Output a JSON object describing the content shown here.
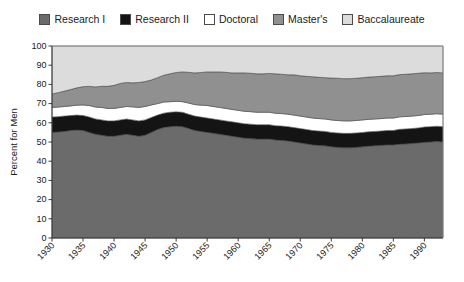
{
  "legend": {
    "position": "top-center",
    "items": [
      {
        "label": "Research I",
        "color": "#6b6b6b",
        "icon": "legend-swatch-icon"
      },
      {
        "label": "Research II",
        "color": "#141414",
        "icon": "legend-swatch-icon"
      },
      {
        "label": "Doctoral",
        "color": "#ffffff",
        "icon": "legend-swatch-icon"
      },
      {
        "label": "Master's",
        "color": "#909090",
        "icon": "legend-swatch-icon"
      },
      {
        "label": "Baccalaureate",
        "color": "#dcdcdc",
        "icon": "legend-swatch-icon"
      }
    ]
  },
  "chart_data": {
    "type": "area",
    "stacked": true,
    "title": "",
    "subtitle": "",
    "xlabel": "",
    "ylabel": "Percent for Men",
    "xlim": [
      1930,
      1993
    ],
    "ylim": [
      0,
      100
    ],
    "grid": false,
    "legend_position": "top-center",
    "ytick_values": [
      0,
      10,
      20,
      30,
      40,
      50,
      60,
      70,
      80,
      90,
      100
    ],
    "ytick_labels": [
      "0",
      "10",
      "20",
      "30",
      "40",
      "50",
      "60",
      "70",
      "80",
      "90",
      "100"
    ],
    "xtick_values": [
      1930,
      1935,
      1940,
      1945,
      1950,
      1955,
      1960,
      1965,
      1970,
      1975,
      1980,
      1985,
      1990
    ],
    "xtick_labels": [
      "1930",
      "1935",
      "1940",
      "1945",
      "1950",
      "1955",
      "1960",
      "1965",
      "1970",
      "1975",
      "1980",
      "1985",
      "1990"
    ],
    "x": [
      1930,
      1931,
      1932,
      1933,
      1934,
      1935,
      1936,
      1937,
      1938,
      1939,
      1940,
      1941,
      1942,
      1943,
      1944,
      1945,
      1946,
      1947,
      1948,
      1949,
      1950,
      1951,
      1952,
      1953,
      1954,
      1955,
      1956,
      1957,
      1958,
      1959,
      1960,
      1961,
      1962,
      1963,
      1964,
      1965,
      1966,
      1967,
      1968,
      1969,
      1970,
      1971,
      1972,
      1973,
      1974,
      1975,
      1976,
      1977,
      1978,
      1979,
      1980,
      1981,
      1982,
      1983,
      1984,
      1985,
      1986,
      1987,
      1988,
      1989,
      1990,
      1991,
      1992,
      1993
    ],
    "series": [
      {
        "name": "Research I",
        "color": "#6b6b6b",
        "values": [
          55.0,
          55.2,
          55.5,
          56.0,
          56.2,
          56.0,
          55.0,
          54.0,
          53.5,
          53.0,
          53.0,
          53.5,
          54.0,
          53.5,
          53.0,
          53.5,
          55.0,
          56.5,
          57.5,
          58.0,
          58.2,
          58.0,
          57.0,
          56.0,
          55.5,
          55.0,
          54.5,
          54.0,
          53.5,
          53.0,
          52.5,
          52.0,
          51.8,
          51.5,
          51.5,
          51.5,
          51.0,
          50.8,
          50.5,
          50.0,
          49.5,
          49.0,
          48.5,
          48.2,
          48.0,
          47.5,
          47.2,
          47.0,
          47.0,
          47.2,
          47.5,
          47.8,
          48.0,
          48.2,
          48.5,
          48.5,
          48.8,
          49.0,
          49.2,
          49.5,
          49.8,
          50.0,
          50.2,
          50.0
        ]
      },
      {
        "name": "Research II",
        "color": "#141414",
        "values": [
          8.0,
          8.0,
          8.0,
          7.8,
          7.8,
          7.8,
          8.0,
          8.0,
          8.0,
          8.0,
          8.0,
          8.0,
          8.0,
          8.0,
          8.0,
          8.0,
          7.8,
          7.5,
          7.5,
          7.5,
          7.5,
          7.5,
          7.5,
          7.5,
          7.5,
          7.5,
          7.5,
          7.5,
          7.5,
          7.5,
          7.5,
          7.5,
          7.5,
          7.5,
          7.5,
          7.5,
          7.5,
          7.5,
          7.5,
          7.5,
          7.5,
          7.5,
          7.5,
          7.5,
          7.5,
          7.5,
          7.5,
          7.5,
          7.5,
          7.5,
          7.5,
          7.5,
          7.5,
          7.5,
          7.5,
          7.5,
          7.8,
          7.8,
          7.8,
          7.8,
          8.0,
          8.0,
          8.0,
          8.0
        ]
      },
      {
        "name": "Doctoral",
        "color": "#ffffff",
        "values": [
          5.0,
          5.0,
          5.0,
          5.0,
          5.2,
          5.5,
          6.0,
          6.2,
          6.5,
          6.5,
          6.5,
          6.5,
          6.5,
          6.8,
          7.0,
          7.0,
          6.5,
          6.0,
          5.8,
          5.5,
          5.5,
          5.5,
          5.8,
          6.0,
          6.2,
          6.5,
          6.5,
          6.5,
          6.5,
          6.5,
          6.5,
          6.5,
          6.5,
          6.5,
          6.5,
          6.5,
          6.5,
          6.5,
          6.5,
          6.5,
          6.5,
          6.5,
          6.5,
          6.5,
          6.5,
          6.5,
          6.5,
          6.5,
          6.5,
          6.5,
          6.5,
          6.5,
          6.5,
          6.5,
          6.5,
          6.5,
          6.5,
          6.5,
          6.5,
          6.5,
          6.5,
          6.5,
          6.5,
          6.5
        ]
      },
      {
        "name": "Master's",
        "color": "#909090",
        "values": [
          7.0,
          7.5,
          8.0,
          8.5,
          9.0,
          9.5,
          10.0,
          10.5,
          11.0,
          11.5,
          12.0,
          12.5,
          12.5,
          12.5,
          13.0,
          13.0,
          13.0,
          13.5,
          14.0,
          14.5,
          15.0,
          15.5,
          16.0,
          16.5,
          17.0,
          17.5,
          18.0,
          18.5,
          18.8,
          19.0,
          19.5,
          20.0,
          20.0,
          20.0,
          20.0,
          20.2,
          20.5,
          20.5,
          20.5,
          21.0,
          21.0,
          21.2,
          21.5,
          21.5,
          21.5,
          21.8,
          22.0,
          22.0,
          22.0,
          22.0,
          22.0,
          22.0,
          22.0,
          22.0,
          22.0,
          22.0,
          22.0,
          22.0,
          22.0,
          22.0,
          21.8,
          21.5,
          21.5,
          21.5
        ]
      },
      {
        "name": "Baccalaureate",
        "color": "#dcdcdc",
        "values": [
          25.0,
          24.3,
          23.5,
          22.7,
          21.8,
          21.2,
          21.0,
          21.3,
          21.0,
          21.0,
          20.5,
          19.5,
          19.0,
          19.2,
          19.0,
          18.5,
          17.7,
          16.5,
          15.2,
          14.5,
          13.8,
          13.5,
          13.7,
          14.0,
          13.8,
          13.5,
          13.5,
          13.5,
          13.7,
          14.0,
          14.0,
          14.0,
          14.2,
          14.5,
          14.5,
          14.3,
          14.5,
          14.7,
          15.0,
          15.0,
          15.5,
          15.8,
          16.0,
          16.3,
          16.5,
          16.7,
          16.8,
          17.0,
          17.0,
          16.8,
          16.5,
          16.2,
          16.0,
          15.8,
          15.5,
          15.5,
          14.9,
          14.7,
          14.5,
          14.2,
          13.9,
          14.0,
          13.8,
          14.0
        ]
      }
    ]
  }
}
